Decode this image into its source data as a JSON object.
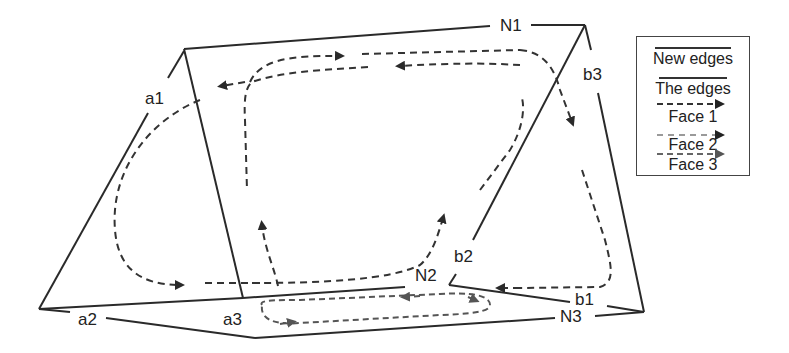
{
  "diagram": {
    "title": "",
    "labels": {
      "N1": "N1",
      "N2": "N2",
      "N3": "N3",
      "a1": "a1",
      "a2": "a2",
      "a3": "a3",
      "b1": "b1",
      "b2": "b2",
      "b3": "b3"
    },
    "legend": {
      "items": [
        {
          "label": "New edges",
          "style": "solid",
          "color": "#333333"
        },
        {
          "label": "The edges",
          "style": "solid",
          "color": "#333333"
        },
        {
          "label": "Face 1",
          "style": "dashed-arrow",
          "color": "#333333"
        },
        {
          "label": "Face 2",
          "style": "dashed-arrow",
          "color": "#9a9a9a"
        },
        {
          "label": "Face 3",
          "style": "dashed-arrow",
          "color": "#666666"
        }
      ]
    },
    "colors": {
      "edge": "#2a2a2a",
      "face1": "#333333",
      "face2": "#9a9a9a",
      "face3": "#555555"
    }
  }
}
